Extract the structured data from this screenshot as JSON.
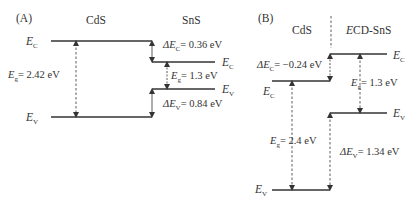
{
  "figure": {
    "panels": [
      {
        "id": "A",
        "label": "(A)",
        "left_material": "CdS",
        "right_material": "SnS",
        "left": {
          "Ec_label": "E",
          "Ec_sub": "C",
          "Ev_label": "E",
          "Ev_sub": "V",
          "Eg_label": "E",
          "Eg_sub": "g",
          "Eg_value": "= 2.42 eV"
        },
        "right": {
          "Ec_label": "E",
          "Ec_sub": "C",
          "Ev_label": "E",
          "Ev_sub": "V",
          "Eg_label": "E",
          "Eg_sub": "g",
          "Eg_value": "= 1.3 eV"
        },
        "delta_Ec": {
          "prefix": "ΔE",
          "sub": "C",
          "value": "= 0.36 eV"
        },
        "delta_Ev": {
          "prefix": "ΔE",
          "sub": "V",
          "value": "= 0.84 eV"
        }
      },
      {
        "id": "B",
        "label": "(B)",
        "left_material": "CdS",
        "right_material_italic": "E",
        "right_material": "CD-SnS",
        "left": {
          "Ec_label": "E",
          "Ec_sub": "C",
          "Ev_label": "E",
          "Ev_sub": "V",
          "Eg_label": "E",
          "Eg_sub": "g",
          "Eg_value": "= 2.4 eV"
        },
        "right": {
          "Ec_label": "E",
          "Ec_sub": "C",
          "Ev_label": "E",
          "Ev_sub": "V",
          "Eg_label": "E",
          "Eg_sub": "g",
          "Eg_value": "= 1.3 eV"
        },
        "delta_Ec": {
          "prefix": "ΔE",
          "sub": "C",
          "value": "= −0.24 eV"
        },
        "delta_Ev": {
          "prefix": "ΔE",
          "sub": "V",
          "value": "= 1.34 eV"
        }
      }
    ],
    "colors": {
      "line": "#333333",
      "text": "#333333",
      "background": "#ffffff"
    }
  }
}
